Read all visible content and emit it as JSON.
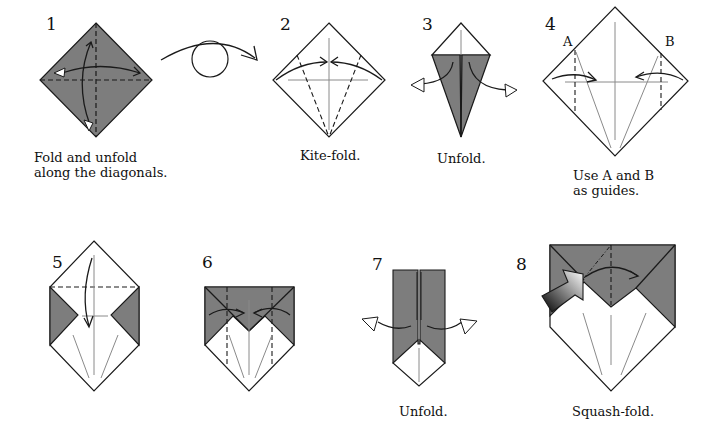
{
  "colors": {
    "paper_colored": "#7d7d7d",
    "paper_white": "#ffffff",
    "line": "#1a1a1a",
    "crease": "#8a8a8a"
  },
  "steps": [
    {
      "number": "1",
      "caption_lines": [
        "Fold and unfold",
        "along the diagonals."
      ]
    },
    {
      "number": "2",
      "caption_lines": [
        "Kite-fold."
      ]
    },
    {
      "number": "3",
      "caption_lines": [
        "Unfold."
      ]
    },
    {
      "number": "4",
      "caption_lines": [
        "Use A and B",
        "as guides."
      ],
      "labels": [
        "A",
        "B"
      ]
    },
    {
      "number": "5",
      "caption_lines": []
    },
    {
      "number": "6",
      "caption_lines": []
    },
    {
      "number": "7",
      "caption_lines": [
        "Unfold."
      ]
    },
    {
      "number": "8",
      "caption_lines": [
        "Squash-fold."
      ]
    }
  ],
  "turnover_symbol": "turn-over-icon"
}
